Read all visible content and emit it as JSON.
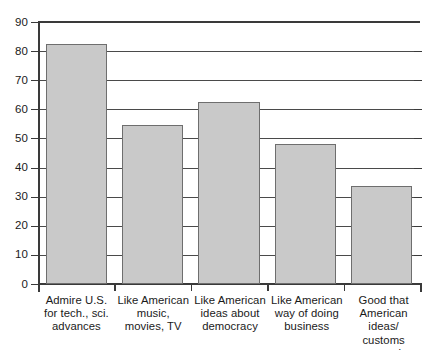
{
  "chart_data": {
    "type": "bar",
    "title": "",
    "subtitle": "",
    "xlabel": "",
    "ylabel": "",
    "ylim": [
      0,
      90
    ],
    "ytick_step": 10,
    "yticks": [
      90,
      80,
      70,
      60,
      50,
      40,
      30,
      20,
      10,
      0
    ],
    "ytick_labels": [
      "90",
      "80",
      "70",
      "60",
      "50",
      "40",
      "30",
      "20",
      "10",
      "0"
    ],
    "grid": "horizontal",
    "legend": "none",
    "bar_fill_color": "#c9c9c9",
    "bar_edge_color": "#6e6e6e",
    "axis_color": "#3a3a3a",
    "categories": [
      "Admire U.S.\nfor tech., sci.\nadvances",
      "Like American\nmusic,\nmovies, TV",
      "Like American\nideas about\ndemocracy",
      "Like American\nway of doing\nbusiness",
      "Good that\nAmerican ideas/\ncustoms spread"
    ],
    "values": [
      82.5,
      54.5,
      62.5,
      48,
      33.5
    ]
  }
}
